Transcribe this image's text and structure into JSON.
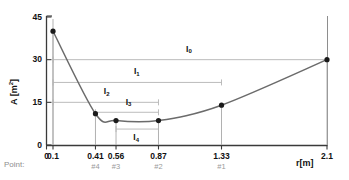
{
  "chart_data": {
    "type": "line",
    "title": "",
    "xlabel": "r[m]",
    "ylabel": "A [m²]",
    "xlim": [
      0,
      2.1
    ],
    "ylim": [
      0,
      45
    ],
    "grid": false,
    "x_ticks": [
      "0",
      "0.1",
      "0.41",
      "0.56",
      "0.87",
      "1.33",
      "2.1"
    ],
    "x_tick_values": [
      0,
      0.1,
      0.41,
      0.56,
      0.87,
      1.33,
      2.1
    ],
    "y_ticks": [
      "0",
      "15",
      "30",
      "45"
    ],
    "y_tick_values": [
      0,
      15,
      30,
      45
    ],
    "series": [
      {
        "name": "A(r)",
        "x": [
          0.1,
          0.41,
          0.56,
          0.87,
          1.33,
          2.1
        ],
        "values": [
          40,
          11,
          8.6,
          8.6,
          14,
          30
        ],
        "marker": "filled-circle",
        "color": "#6b6b6b"
      }
    ],
    "point_row_caption": "Point:",
    "point_labels": [
      {
        "label": "#4",
        "x": 0.41
      },
      {
        "label": "#3",
        "x": 0.56
      },
      {
        "label": "#2",
        "x": 0.87
      },
      {
        "label": "#1",
        "x": 1.33
      }
    ],
    "annotations": [
      {
        "name": "I0",
        "label": "I",
        "sub": "0",
        "x_from": 0.1,
        "x_to": 2.1,
        "y": 30,
        "label_x": 1.1,
        "label_y": 33.5
      },
      {
        "name": "I1",
        "label": "I",
        "sub": "1",
        "x_from": 0.1,
        "x_to": 1.33,
        "y": 22,
        "label_x": 0.72,
        "label_y": 25.5
      },
      {
        "name": "I2",
        "label": "I",
        "sub": "2",
        "x_from": 0.1,
        "x_to": 0.87,
        "y": 15,
        "label_x": 0.5,
        "label_y": 18.5
      },
      {
        "name": "I3",
        "label": "I",
        "sub": "3",
        "x_from": 0.41,
        "x_to": 0.87,
        "y": 11.5,
        "label_x": 0.66,
        "label_y": 14.8
      },
      {
        "name": "I4",
        "label": "I",
        "sub": "4",
        "x_from": 0.56,
        "x_to": 0.87,
        "y": 5.6,
        "label_x": 0.715,
        "label_y": 2.4
      }
    ],
    "colors": {
      "curve": "#6b6b6b",
      "marker": "#1a1a1a",
      "axis": "#3a3a3a",
      "annotation_line": "#b4b4b4",
      "drop_line": "#a8a8a8",
      "point_label": "#9a9a9a",
      "background": "#ffffff"
    }
  }
}
